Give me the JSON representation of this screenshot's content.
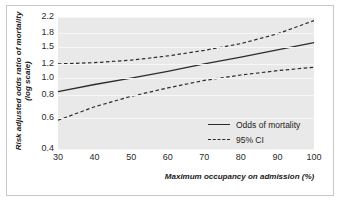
{
  "chart_data": {
    "type": "line",
    "title": "",
    "xlabel": "Maximum occupancy on admission (%)",
    "ylabel": "Risk adjusted odds ratio of mortality (log scale)",
    "yscale": "log",
    "xlim": [
      30,
      100
    ],
    "ylim": [
      0.4,
      2.2
    ],
    "xticks": [
      30,
      40,
      50,
      60,
      70,
      80,
      90,
      100
    ],
    "xtick_labels": [
      "30",
      "40",
      "50",
      "60",
      "70",
      "80",
      "90",
      "100"
    ],
    "yticks": [
      0.4,
      0.6,
      0.8,
      1.0,
      1.2,
      1.5,
      1.8,
      2.2
    ],
    "ytick_labels": [
      "0.4",
      "0.6",
      "0.8",
      "1.0",
      "1.2",
      "1.5",
      "1.8",
      "2.2"
    ],
    "grid": true,
    "grid_color": "#f7f7f7",
    "plot_background": "#e9e9e9",
    "legend_position": "inside-bottom-right",
    "x": [
      30,
      40,
      50,
      60,
      70,
      80,
      90,
      100
    ],
    "series": [
      {
        "name": "Odds of mortality",
        "style": "solid",
        "color": "#2b2b2b",
        "values": [
          0.84,
          0.92,
          1.0,
          1.09,
          1.2,
          1.31,
          1.44,
          1.58
        ]
      },
      {
        "name": "95% CI upper",
        "style": "dashed",
        "color": "#2b2b2b",
        "values": [
          1.2,
          1.22,
          1.26,
          1.33,
          1.43,
          1.56,
          1.77,
          2.1
        ]
      },
      {
        "name": "95% CI lower",
        "style": "dashed",
        "color": "#2b2b2b",
        "values": [
          0.58,
          0.69,
          0.79,
          0.88,
          0.97,
          1.04,
          1.1,
          1.15
        ]
      }
    ]
  },
  "legend": {
    "entries": [
      {
        "label": "Odds of mortality",
        "style": "solid"
      },
      {
        "label": "95% CI",
        "style": "dashed"
      }
    ]
  },
  "axes": {
    "y_title": "Risk adjusted odds ratio of mortality (log scale)",
    "x_title": "Maximum occupancy on admission (%)"
  }
}
